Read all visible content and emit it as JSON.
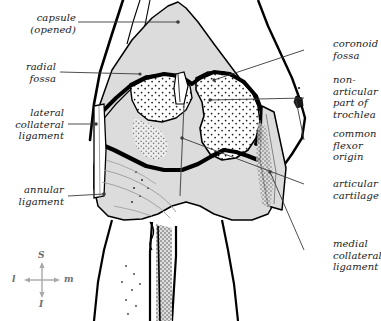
{
  "figure": {
    "bone_fill": "#dcdcdc",
    "outline_color": "#000000",
    "leader_color": "#3a3a3a",
    "compass_color": "#8a8a8a"
  },
  "labels": {
    "capsule": "capsule\n(opened)",
    "radial_fossa": "radial\nfossa",
    "lateral_collateral_ligament": "lateral\ncollateral\nligament",
    "annular_ligament": "annular\nligament",
    "coronoid_fossa": "coronoid\nfossa",
    "non_articular_part_of_trochlea": "non-\narticular\npart of\ntrochlea",
    "common_flexor_origin": "common\nflexor\norigin",
    "articular_cartilage": "articular\ncartilage",
    "medial_collateral_ligament": "medial\ncollateral\nligament"
  },
  "compass": {
    "superior": "S",
    "inferior": "I",
    "lateral": "l",
    "medial": "m"
  }
}
